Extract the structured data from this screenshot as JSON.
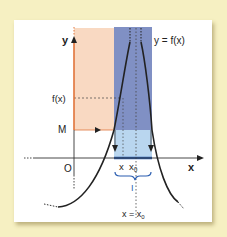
{
  "diagram": {
    "type": "function-limit-infinity",
    "colors": {
      "background": "#f6f0c2",
      "card": "#ffffff",
      "peach_band": "#f9d9c2",
      "blue_band_dark": "#8090c4",
      "blue_band_light": "#b9d6ef",
      "y_axis_accent": "#e0743a",
      "curve": "#222222",
      "interval_brace": "#2a5db0"
    },
    "labels": {
      "y_axis": "y",
      "x_axis": "x",
      "origin": "O",
      "curve": "y = f(x)",
      "fx_level": "f(x)",
      "m_level": "M",
      "x_tick": "x",
      "x0_tick": "x",
      "x0_sub": "0",
      "interval": "I",
      "asymptote": "x = x",
      "asymptote_sub": "0"
    }
  }
}
